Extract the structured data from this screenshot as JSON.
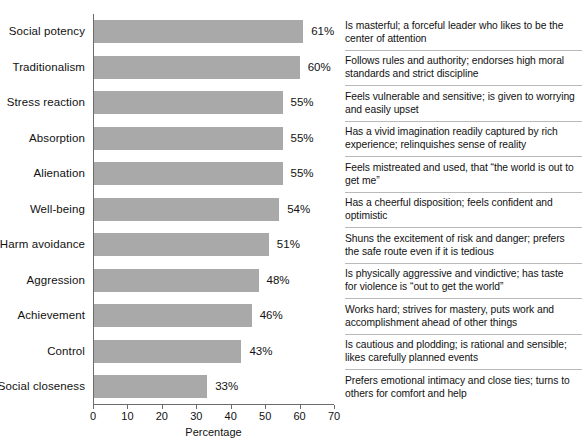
{
  "chart_data": {
    "type": "bar",
    "orientation": "horizontal",
    "title": "",
    "xlabel": "Percentage",
    "ylabel": "",
    "xlim": [
      0,
      70
    ],
    "xticks": [
      0,
      10,
      20,
      30,
      40,
      50,
      60,
      70
    ],
    "grid": false,
    "legend": null,
    "bar_color": "#a9a9a9",
    "value_suffix": "%",
    "categories": [
      "Social potency",
      "Traditionalism",
      "Stress reaction",
      "Absorption",
      "Alienation",
      "Well-being",
      "Harm avoidance",
      "Aggression",
      "Achievement",
      "Control",
      "Social closeness"
    ],
    "values": [
      61,
      60,
      55,
      55,
      55,
      54,
      51,
      48,
      46,
      43,
      33
    ],
    "value_labels": [
      "61%",
      "60%",
      "55%",
      "55%",
      "55%",
      "54%",
      "51%",
      "48%",
      "46%",
      "43%",
      "33%"
    ],
    "annotations": [
      "Is masterful; a forceful leader who likes to be the center of attention",
      "Follows rules and authority; endorses high moral standards and strict discipline",
      "Feels vulnerable and sensitive; is given to worrying and easily upset",
      "Has a vivid imagination readily captured by rich experience; relinquishes sense of reality",
      "Feels mistreated and used, that “the world is out to get me”",
      "Has a cheerful disposition; feels confident and optimistic",
      "Shuns the excitement of risk and danger; prefers the safe route even if it is tedious",
      "Is physically aggressive and vindictive; has taste for violence is “out to get the world”",
      "Works hard; strives for mastery, puts work and accomplishment ahead of other things",
      "Is cautious and plodding; is rational and sensible; likes carefully planned events",
      "Prefers emotional intimacy and close ties; turns to others for comfort and help"
    ]
  }
}
